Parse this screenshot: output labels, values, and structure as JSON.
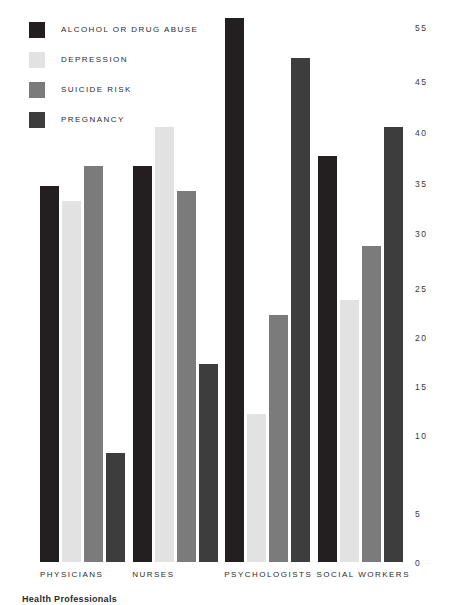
{
  "chart_data": {
    "type": "bar",
    "title": "",
    "subtitle": "",
    "xlabel": "",
    "ylabel": "",
    "categories": [
      "PHYSICIANS",
      "NURSES",
      "PSYCHOLOGISTS",
      "SOCIAL WORKERS"
    ],
    "series": [
      {
        "name": "ALCOHOL OR DRUG ABUSE",
        "color": "#231f20",
        "values": [
          38,
          40,
          55,
          41
        ]
      },
      {
        "name": "DEPRESSION",
        "color": "#e2e2e2",
        "values": [
          36.5,
          44,
          15,
          26.5
        ]
      },
      {
        "name": "SUICIDE RISK",
        "color": "#7b7b7b",
        "values": [
          40,
          37.5,
          25,
          32
        ]
      },
      {
        "name": "PREGNANCY",
        "color": "#3d3d3d",
        "values": [
          11,
          20,
          51,
          44
        ]
      }
    ],
    "ylim": [
      0,
      55
    ],
    "ytick_labels": [
      "55",
      "45",
      "40",
      "35",
      "30",
      "25",
      "20",
      "15",
      "10",
      "5",
      "0"
    ],
    "ytick_values": [
      55,
      45,
      40,
      35,
      30,
      25,
      20,
      15,
      10,
      5,
      0
    ],
    "grid": false,
    "legend_position": "top-left",
    "bar_width_px": 19,
    "bar_gap_px": 3
  },
  "caption": "Health Professionals",
  "colors": {
    "background": "#ffffff",
    "text": "#2b2b2b",
    "axis_text": "#3a3a3a"
  }
}
